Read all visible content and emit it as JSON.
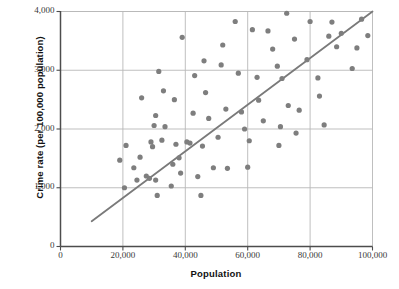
{
  "chart_data": {
    "type": "scatter",
    "title": "",
    "xlabel": "Population",
    "ylabel": "Crime rate (per 100,000 population)",
    "xlim": [
      0,
      100000
    ],
    "ylim": [
      0,
      4000
    ],
    "xticks": [
      0,
      20000,
      40000,
      60000,
      80000,
      100000
    ],
    "xtick_labels": [
      "0",
      "20,000",
      "40,000",
      "60,000",
      "80,000",
      "100,000"
    ],
    "yticks": [
      0,
      1000,
      2000,
      3000,
      4000
    ],
    "ytick_labels": [
      "0",
      "1,000",
      "2,000",
      "3,000",
      "4,000"
    ],
    "grid": true,
    "grid_color": "#b8b8b8",
    "axis_color": "#4d4d4d",
    "marker_color": "#7e7e7e",
    "marker_radius": 2.6,
    "legend": null,
    "trendline": {
      "label": "",
      "color": "#7a7a7a",
      "width": 1.8,
      "x_start": 10000,
      "y_start": 430,
      "x_end": 100000,
      "y_end": 4000
    },
    "points": [
      [
        19000,
        1470
      ],
      [
        20500,
        1000
      ],
      [
        21000,
        1720
      ],
      [
        23500,
        1340
      ],
      [
        24500,
        1130
      ],
      [
        25500,
        1520
      ],
      [
        26000,
        2530
      ],
      [
        27500,
        1200
      ],
      [
        28500,
        1160
      ],
      [
        29000,
        1780
      ],
      [
        29500,
        1700
      ],
      [
        30000,
        2060
      ],
      [
        30500,
        2230
      ],
      [
        30500,
        1130
      ],
      [
        31000,
        870
      ],
      [
        31500,
        2980
      ],
      [
        32500,
        1810
      ],
      [
        33000,
        2650
      ],
      [
        33500,
        2040
      ],
      [
        35500,
        1030
      ],
      [
        36000,
        1400
      ],
      [
        36500,
        2500
      ],
      [
        37000,
        1740
      ],
      [
        38000,
        1510
      ],
      [
        38500,
        1250
      ],
      [
        39000,
        3560
      ],
      [
        40500,
        1780
      ],
      [
        41500,
        1760
      ],
      [
        42500,
        2270
      ],
      [
        43000,
        2910
      ],
      [
        44000,
        1190
      ],
      [
        45000,
        870
      ],
      [
        45500,
        1710
      ],
      [
        46000,
        3160
      ],
      [
        46500,
        2620
      ],
      [
        47500,
        2180
      ],
      [
        49000,
        1340
      ],
      [
        50500,
        1860
      ],
      [
        51500,
        3090
      ],
      [
        52000,
        3430
      ],
      [
        53000,
        2340
      ],
      [
        53500,
        1330
      ],
      [
        56000,
        3830
      ],
      [
        57000,
        2950
      ],
      [
        58000,
        2290
      ],
      [
        59000,
        2000
      ],
      [
        60000,
        1350
      ],
      [
        60500,
        1800
      ],
      [
        61500,
        3690
      ],
      [
        63000,
        2880
      ],
      [
        63500,
        2490
      ],
      [
        65000,
        2140
      ],
      [
        66500,
        3670
      ],
      [
        68000,
        3360
      ],
      [
        69500,
        3070
      ],
      [
        70000,
        1720
      ],
      [
        70500,
        2040
      ],
      [
        71000,
        2860
      ],
      [
        72500,
        3970
      ],
      [
        73000,
        2400
      ],
      [
        75000,
        3530
      ],
      [
        75500,
        1930
      ],
      [
        76500,
        2320
      ],
      [
        79000,
        3180
      ],
      [
        80000,
        3830
      ],
      [
        82500,
        2870
      ],
      [
        83000,
        2560
      ],
      [
        84500,
        2070
      ],
      [
        86000,
        3580
      ],
      [
        87000,
        3820
      ],
      [
        88500,
        3400
      ],
      [
        90000,
        3630
      ],
      [
        93500,
        3030
      ],
      [
        95000,
        3380
      ],
      [
        96500,
        3870
      ],
      [
        98500,
        3590
      ]
    ]
  }
}
